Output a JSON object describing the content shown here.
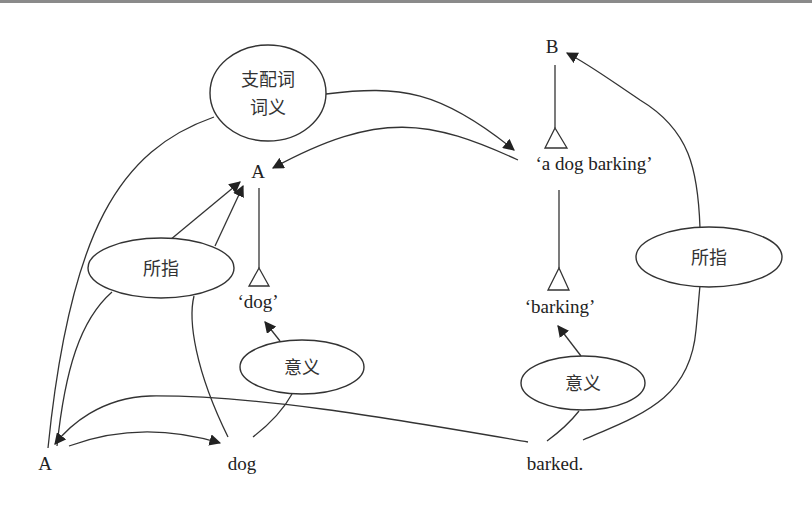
{
  "diagram": {
    "nodes": {
      "top_a": "A",
      "top_b": "B",
      "dog_meaning": "‘dog’",
      "phrase_meaning": "‘a dog barking’",
      "barking_meaning": "‘barking’",
      "bottom_a": "A",
      "word_dog": "dog",
      "word_barked": "barked."
    },
    "ellipses": {
      "head_sense_line1": "支配词",
      "head_sense_line2": "词义",
      "referent_left": "所指",
      "sense_left": "意义",
      "sense_right": "意义",
      "referent_right": "所指"
    },
    "colors": {
      "line": "#333333",
      "text": "#222222",
      "background": "#ffffff",
      "top_border": "#8a8a8a"
    }
  }
}
